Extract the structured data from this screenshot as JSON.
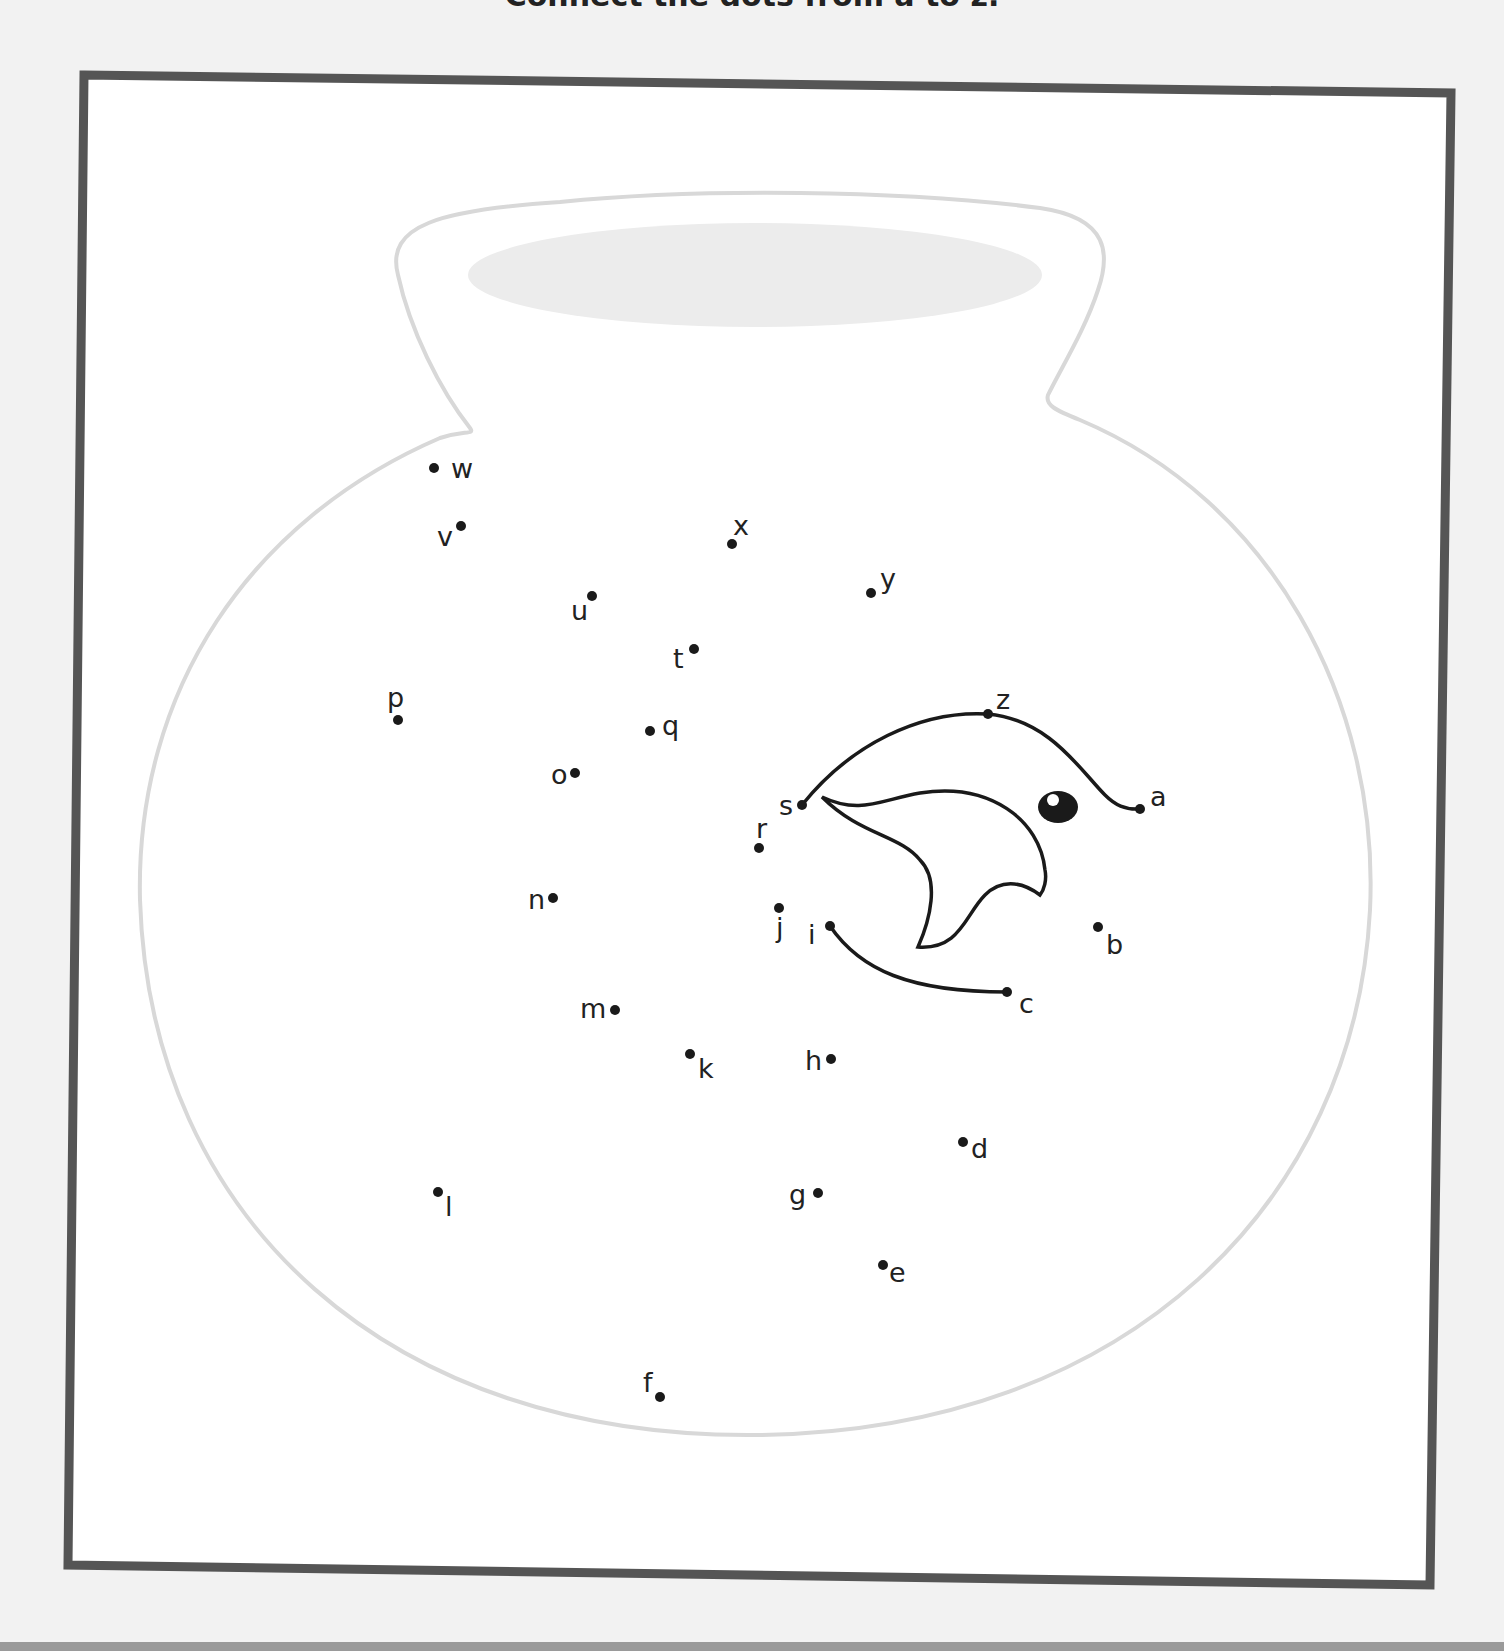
{
  "page": {
    "instruction_fragment": "Connect the dots from a to z.",
    "colors": {
      "background": "#f2f2f2",
      "frame": "#555555",
      "bowl_outline": "#d8d8d8",
      "water": "#ececec",
      "ink": "#1a1a1a",
      "bottom_band": "#9a9a9a"
    }
  },
  "worksheet": {
    "title": "Fish bowl connect-the-dots",
    "dots": [
      {
        "label": "a",
        "x": 1140,
        "y": 809,
        "lx": 1150,
        "ly": 806
      },
      {
        "label": "b",
        "x": 1098,
        "y": 927,
        "lx": 1106,
        "ly": 954
      },
      {
        "label": "c",
        "x": 1007,
        "y": 992,
        "lx": 1019,
        "ly": 1013
      },
      {
        "label": "d",
        "x": 963,
        "y": 1142,
        "lx": 971,
        "ly": 1158
      },
      {
        "label": "e",
        "x": 883,
        "y": 1265,
        "lx": 889,
        "ly": 1282
      },
      {
        "label": "f",
        "x": 660,
        "y": 1397,
        "lx": 643,
        "ly": 1392
      },
      {
        "label": "g",
        "x": 818,
        "y": 1193,
        "lx": 789,
        "ly": 1204
      },
      {
        "label": "h",
        "x": 831,
        "y": 1059,
        "lx": 805,
        "ly": 1070
      },
      {
        "label": "i",
        "x": 830,
        "y": 926,
        "lx": 808,
        "ly": 944
      },
      {
        "label": "j",
        "x": 779,
        "y": 908,
        "lx": 776,
        "ly": 937
      },
      {
        "label": "k",
        "x": 690,
        "y": 1054,
        "lx": 698,
        "ly": 1078
      },
      {
        "label": "l",
        "x": 438,
        "y": 1192,
        "lx": 445,
        "ly": 1216
      },
      {
        "label": "m",
        "x": 615,
        "y": 1010,
        "lx": 580,
        "ly": 1018
      },
      {
        "label": "n",
        "x": 553,
        "y": 898,
        "lx": 528,
        "ly": 909
      },
      {
        "label": "o",
        "x": 575,
        "y": 773,
        "lx": 551,
        "ly": 784
      },
      {
        "label": "p",
        "x": 398,
        "y": 720,
        "lx": 387,
        "ly": 707
      },
      {
        "label": "q",
        "x": 650,
        "y": 731,
        "lx": 662,
        "ly": 735
      },
      {
        "label": "r",
        "x": 759,
        "y": 848,
        "lx": 756,
        "ly": 838
      },
      {
        "label": "s",
        "x": 802,
        "y": 805,
        "lx": 779,
        "ly": 815
      },
      {
        "label": "t",
        "x": 694,
        "y": 649,
        "lx": 673,
        "ly": 668
      },
      {
        "label": "u",
        "x": 592,
        "y": 596,
        "lx": 571,
        "ly": 620
      },
      {
        "label": "v",
        "x": 461,
        "y": 526,
        "lx": 437,
        "ly": 546
      },
      {
        "label": "w",
        "x": 434,
        "y": 468,
        "lx": 451,
        "ly": 478
      },
      {
        "label": "x",
        "x": 732,
        "y": 544,
        "lx": 733,
        "ly": 535
      },
      {
        "label": "y",
        "x": 871,
        "y": 593,
        "lx": 880,
        "ly": 588
      },
      {
        "label": "z",
        "x": 988,
        "y": 714,
        "lx": 996,
        "ly": 709
      }
    ],
    "drawn_segments": [
      "s-z-a",
      "i-c"
    ]
  }
}
